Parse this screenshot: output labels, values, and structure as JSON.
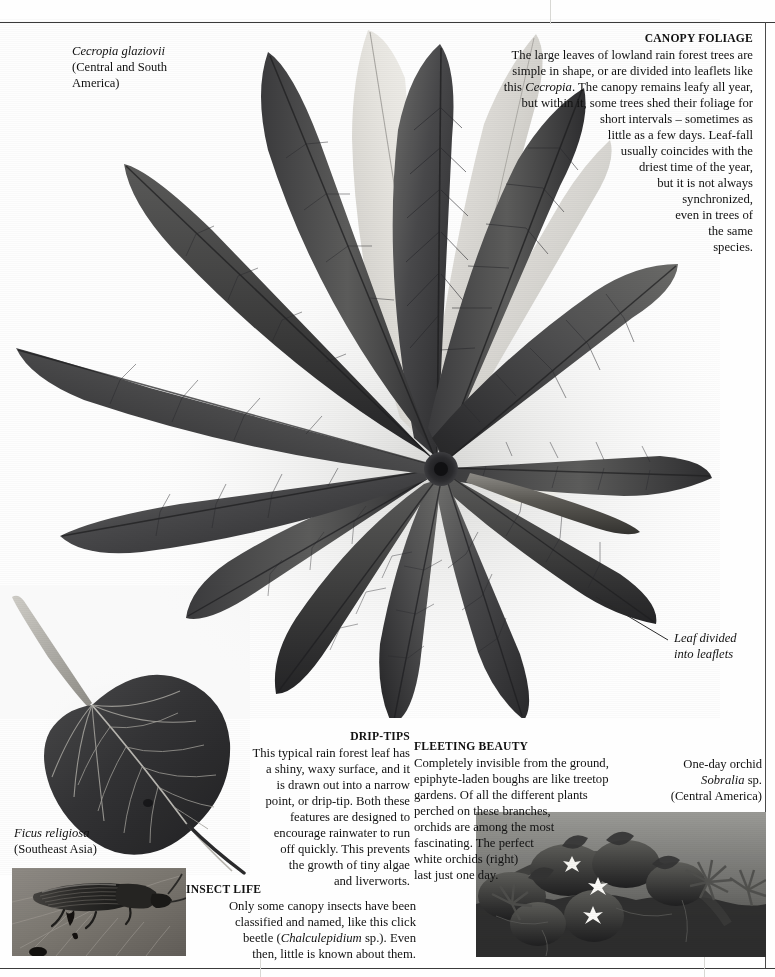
{
  "page": {
    "background_color": "#fefefe",
    "rule_color": "#3a3a3a",
    "gutter_color": "#d8d8d4"
  },
  "specimen_labels": {
    "cecropia": {
      "species": "Cecropia glaziovii",
      "origin_line1": "(Central and South",
      "origin_line2": "America)"
    },
    "ficus": {
      "species": "Ficus religiosa",
      "origin": "(Southeast Asia)"
    },
    "orchid": {
      "common_name": "One-day orchid",
      "species": "Sobralia",
      "species_suffix": " sp.",
      "origin": "(Central America)"
    }
  },
  "annotations": {
    "leaf_divided": {
      "line1": "Leaf divided",
      "line2": "into leaflets"
    }
  },
  "articles": {
    "canopy_foliage": {
      "heading": "CANOPY FOLIAGE",
      "lines": [
        "The large leaves of lowland rain forest trees are",
        "simple in shape, or are divided into leaflets like",
        "this |Cecropia|. The canopy remains leafy all year,",
        "but within it, some trees shed their foliage for",
        "short intervals – sometimes as",
        "little as a few days. Leaf-fall",
        "usually coincides with the",
        "driest time of the year,",
        "but it is not always",
        "synchronized,",
        "even in trees of",
        "the same",
        "species."
      ]
    },
    "drip_tips": {
      "heading": "DRIP-TIPS",
      "lines": [
        "This typical rain forest leaf has",
        "a shiny, waxy surface, and it",
        "is drawn out into a narrow",
        "point, or drip-tip. Both these",
        "features are designed to",
        "encourage rainwater to run",
        "off quickly. This prevents",
        "the growth of tiny algae",
        "and liverworts."
      ]
    },
    "fleeting_beauty": {
      "heading": "FLEETING BEAUTY",
      "lines": [
        "Completely invisible from the ground,",
        "epiphyte-laden boughs are like treetop",
        "gardens. Of all the different plants",
        "perched on these branches,",
        "orchids are among the most",
        "fascinating. The perfect",
        "white orchids (right)",
        "last just one day."
      ]
    },
    "insect_life": {
      "heading": "INSECT LIFE",
      "lines": [
        "Only some canopy insects have been",
        "classified and named, like this click",
        "beetle (|Chalculepidium| sp.). Even",
        "then, little is known about them."
      ]
    }
  },
  "photographs": {
    "cecropia_leaf": {
      "subject": "cecropia-palmate-leaf",
      "leaflet_count": 13
    },
    "ficus_leaf": {
      "subject": "ficus-religiosa-leaf-with-drip-tip"
    },
    "orchid_bough": {
      "subject": "epiphyte-laden-bough-with-white-orchids",
      "flower_count": 3
    },
    "click_beetle": {
      "subject": "click-beetle-on-leaf"
    }
  }
}
